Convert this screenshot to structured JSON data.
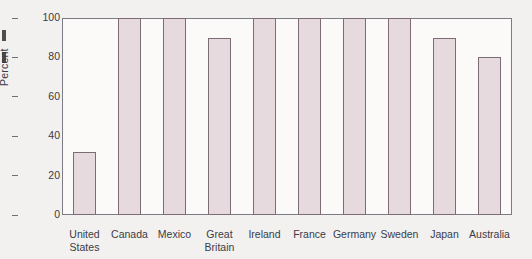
{
  "chart_data": {
    "type": "bar",
    "title": "",
    "xlabel": "",
    "ylabel": "Percent",
    "ylim": [
      0,
      100
    ],
    "yticks": [
      0,
      20,
      40,
      60,
      80,
      100
    ],
    "grid": false,
    "legend": null,
    "categories": [
      "United States",
      "Canada",
      "Mexico",
      "Great Britain",
      "Ireland",
      "France",
      "Germany",
      "Sweden",
      "Japan",
      "Australia"
    ],
    "category_lines": [
      [
        "United",
        "States"
      ],
      [
        "Canada"
      ],
      [
        "Mexico"
      ],
      [
        "Great",
        "Britain"
      ],
      [
        "Ireland"
      ],
      [
        "France"
      ],
      [
        "Germany"
      ],
      [
        "Sweden"
      ],
      [
        "Japan"
      ],
      [
        "Australia"
      ]
    ],
    "values": [
      32,
      100,
      100,
      90,
      100,
      100,
      100,
      100,
      90,
      80
    ],
    "colors": {
      "bar_fill": "#e6dade",
      "bar_border": "#7d6b75",
      "axis": "#7c7c84",
      "text": "#3b3b48",
      "background": "#f2f1ef",
      "plot_background": "#fbfaf9"
    }
  }
}
